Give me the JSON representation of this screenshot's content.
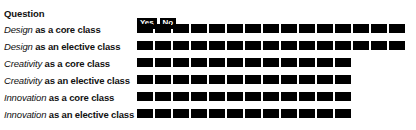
{
  "chart_data": {
    "type": "bar",
    "title": "",
    "xlabel": "",
    "ylabel": "",
    "orientation": "horizontal",
    "stacked": true,
    "units": "blocks",
    "grid": false,
    "legend_position": "top",
    "column_header": "Question",
    "legend": [
      {
        "name": "Yes",
        "color": "#000000"
      },
      {
        "name": "No",
        "color": "#000000"
      }
    ],
    "categories": [
      "Design as a core class",
      "Design as an elective class",
      "Creativity as a core class",
      "Creativity as an elective class",
      "Innovation as a core class",
      "Innovation as an elective class"
    ],
    "values": [
      15,
      15,
      12,
      12,
      12,
      12
    ],
    "series": [
      {
        "name": "Yes",
        "values": [
          15,
          15,
          12,
          12,
          12,
          12
        ]
      },
      {
        "name": "No",
        "values": [
          0,
          0,
          0,
          0,
          0,
          0
        ]
      }
    ]
  },
  "header": {
    "question_label": "Question"
  },
  "legend": {
    "yes_label": "Yes",
    "no_label": "No",
    "yes_color": "#000000",
    "no_color": "#000000"
  },
  "rows": [
    {
      "subject": "Design",
      "rest": " as a core class",
      "yes": 15,
      "no": 0
    },
    {
      "subject": "Design",
      "rest": " as an elective class",
      "yes": 15,
      "no": 0
    },
    {
      "subject": "Creativity",
      "rest": " as a core class",
      "yes": 12,
      "no": 0
    },
    {
      "subject": "Creativity",
      "rest": " as an elective class",
      "yes": 12,
      "no": 0
    },
    {
      "subject": "Innovation",
      "rest": " as a core class",
      "yes": 12,
      "no": 0
    },
    {
      "subject": "Innovation",
      "rest": " as an elective class",
      "yes": 12,
      "no": 0
    }
  ]
}
